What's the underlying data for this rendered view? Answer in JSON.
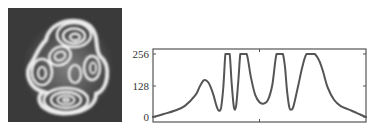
{
  "figure": {
    "left_panel": {
      "type": "image",
      "description": "grayscale interference fringe pattern",
      "background_color": "#3a3a3a",
      "fringe_color": "#f2f2f2"
    }
  },
  "chart_data": {
    "type": "line",
    "title": "",
    "xlabel": "",
    "ylabel": "",
    "y_ticks": [
      0,
      128,
      256
    ],
    "y_tick_labels": [
      "0",
      "128",
      "256"
    ],
    "ylim": [
      0,
      256
    ],
    "x_ticks": [],
    "grid": false,
    "legend": null,
    "line_color": "#555555",
    "series": [
      {
        "name": "intensity profile",
        "x": [
          0,
          5,
          10,
          15,
          20,
          22,
          24,
          26,
          28,
          30,
          31,
          32,
          33,
          34,
          35,
          36,
          37,
          38,
          39,
          40,
          41,
          42,
          44,
          46,
          48,
          50,
          52,
          54,
          56,
          58,
          60,
          61,
          62,
          63,
          64,
          65,
          66,
          68,
          70,
          72,
          74,
          75,
          76,
          78,
          80,
          82,
          85,
          88,
          92,
          96,
          100
        ],
        "values": [
          0,
          12,
          25,
          45,
          90,
          125,
          150,
          140,
          100,
          40,
          25,
          40,
          120,
          256,
          256,
          256,
          130,
          40,
          45,
          140,
          256,
          256,
          256,
          160,
          90,
          60,
          55,
          70,
          130,
          256,
          256,
          256,
          200,
          100,
          40,
          30,
          45,
          120,
          200,
          256,
          256,
          256,
          256,
          230,
          180,
          120,
          70,
          45,
          30,
          15,
          0
        ]
      }
    ]
  }
}
